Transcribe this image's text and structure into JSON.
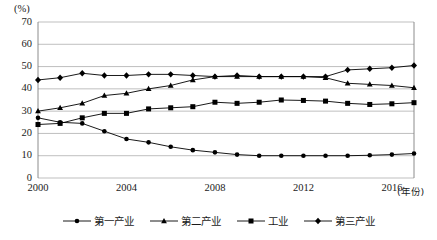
{
  "chart_data": {
    "type": "line",
    "title": "",
    "unit_label": "(%)",
    "xlabel": "(年份)",
    "ylabel": "",
    "grid": true,
    "legend_position": "bottom",
    "xlim": [
      2000,
      2017
    ],
    "ylim": [
      0,
      70
    ],
    "yticks": [
      70,
      60,
      50,
      40,
      30,
      20,
      10,
      0
    ],
    "ytick_labels": [
      "70",
      "60",
      "50",
      "40",
      "30",
      "20",
      "10",
      "0"
    ],
    "xticks": [
      2000,
      2004,
      2008,
      2012,
      2016
    ],
    "xtick_labels": [
      "2000",
      "2004",
      "2008",
      "2012",
      "2016"
    ],
    "x": [
      2000,
      2001,
      2002,
      2003,
      2004,
      2005,
      2006,
      2007,
      2008,
      2009,
      2010,
      2011,
      2012,
      2013,
      2014,
      2015,
      2016,
      2017
    ],
    "series": [
      {
        "name": "第一产业",
        "marker": "circle",
        "values": [
          27,
          25,
          24.5,
          21,
          17.5,
          16,
          14,
          12.5,
          11.5,
          10.5,
          10,
          10,
          10,
          10,
          10,
          10.2,
          10.5,
          11
        ]
      },
      {
        "name": "第二产业",
        "marker": "triangle",
        "values": [
          30,
          31.5,
          33.5,
          37,
          38,
          40,
          41.5,
          44,
          45.5,
          45.5,
          45.5,
          45.5,
          45.5,
          45,
          42.5,
          42,
          41.5,
          40.5
        ]
      },
      {
        "name": "工业",
        "marker": "square",
        "values": [
          24,
          24.5,
          27,
          29,
          29,
          31,
          31.5,
          32,
          34,
          33.5,
          34,
          35,
          34.8,
          34.5,
          33.5,
          33,
          33.3,
          33.8
        ]
      },
      {
        "name": "第三产业",
        "marker": "diamond",
        "values": [
          44,
          45,
          47,
          46,
          46,
          46.5,
          46.5,
          46,
          45.5,
          46,
          45.5,
          45.5,
          45.5,
          45.5,
          48.5,
          49,
          49.5,
          50.5
        ]
      }
    ],
    "colors": {
      "line": "#000000",
      "marker": "#000000",
      "grid": "#b8b8b8",
      "axis": "#808080",
      "text": "#1a1a1a"
    }
  },
  "legend": {
    "entries": [
      {
        "label": "第一产业"
      },
      {
        "label": "第二产业"
      },
      {
        "label": "工业"
      },
      {
        "label": "第三产业"
      }
    ]
  }
}
